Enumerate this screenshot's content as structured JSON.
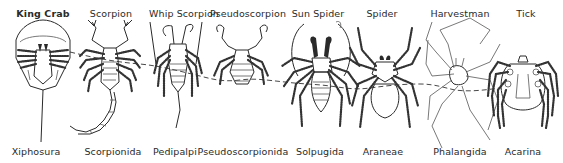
{
  "figure": {
    "specimens": [
      {
        "common_name": "King Crab",
        "order": "Xiphosura"
      },
      {
        "common_name": "Scorpion",
        "order": "Scorpionida"
      },
      {
        "common_name": "Whip Scorpion",
        "order": "Pedipalpi"
      },
      {
        "common_name": "Pseudoscorpion",
        "order": "Pseudoscorpionida"
      },
      {
        "common_name": "Sun Spider",
        "order": "Solpugida"
      },
      {
        "common_name": "Spider",
        "order": "Araneae"
      },
      {
        "common_name": "Harvestman",
        "order": "Phalangida"
      },
      {
        "common_name": "Tick",
        "order": "Acarina"
      }
    ],
    "connector": "dashed-line-linking-specimens"
  }
}
